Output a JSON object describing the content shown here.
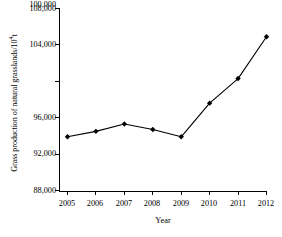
{
  "chart_data": {
    "type": "line",
    "title": "",
    "subtitle": "",
    "xlabel": "Year",
    "ylabel": "Grass production of natural grasslands/10⁴t",
    "ylabel_text": "Grass production of natural grasslands/10",
    "ylabel_exponent": "4",
    "ylabel_unit": "t",
    "categories": [
      "2005",
      "2006",
      "2007",
      "2008",
      "2009",
      "2010",
      "2011",
      "2012"
    ],
    "x": [
      2005,
      2006,
      2007,
      2008,
      2009,
      2010,
      2011,
      2012
    ],
    "values": [
      93900,
      94500,
      95300,
      94700,
      93900,
      97600,
      100300,
      104900
    ],
    "series": [
      {
        "name": "Grass production of natural grasslands",
        "values": [
          93900,
          94500,
          95300,
          94700,
          93900,
          97600,
          100300,
          104900
        ]
      }
    ],
    "ylim": [
      88000,
      108000
    ],
    "yticks": [
      88000,
      92000,
      96000,
      100000,
      104000,
      108000
    ],
    "ytick_labels": [
      "88,000",
      "92,000",
      "96,000",
      "100,000",
      "104,000",
      "108,000"
    ],
    "xtick_labels": [
      "2005",
      "2006",
      "2007",
      "2008",
      "2009",
      "2010",
      "2011",
      "2012"
    ],
    "grid": false,
    "legend": false,
    "legend_position": "none",
    "line_color": "#000000",
    "marker_color": "#000000",
    "marker_shape": "diamond",
    "axis_color": "#000000",
    "background_color": "#ffffff"
  },
  "axes": {
    "y_tick_labels": [
      "108,000",
      "104,000",
      "100,000",
      "96,000",
      "92,000",
      "88,000"
    ],
    "x_tick_labels": [
      "2005",
      "2006",
      "2007",
      "2008",
      "2009",
      "2010",
      "2011",
      "2012"
    ],
    "x_axis_title": "Year"
  }
}
